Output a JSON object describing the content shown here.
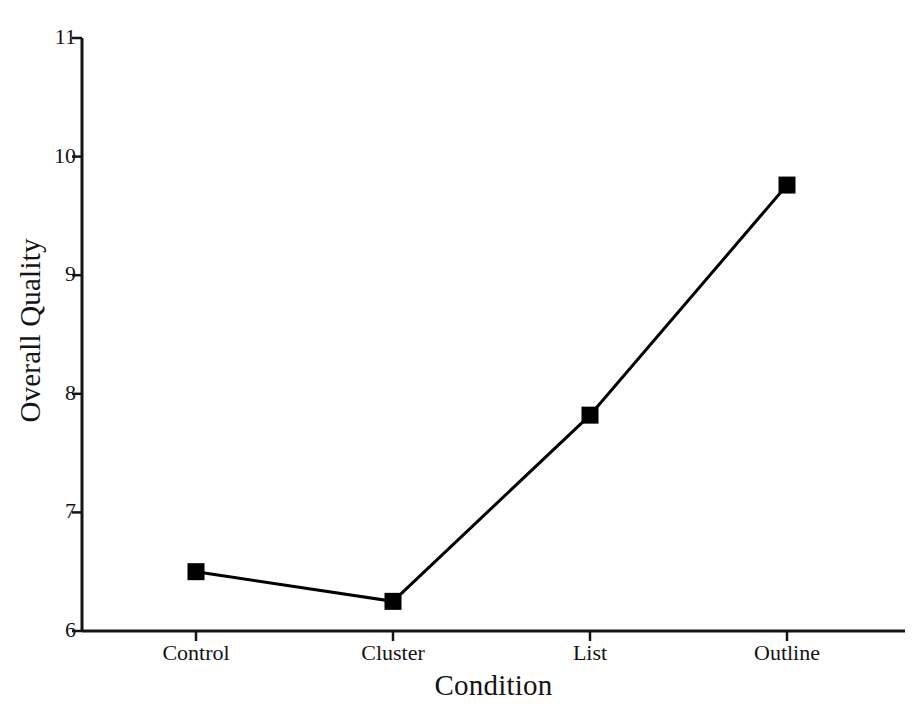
{
  "chart_data": {
    "type": "line",
    "title": "",
    "xlabel": "Condition",
    "ylabel": "Overall Quality",
    "categories": [
      "Control",
      "Cluster",
      "List",
      "Outline"
    ],
    "values": [
      6.5,
      6.25,
      7.82,
      9.76
    ],
    "series": [
      {
        "name": "Overall Quality",
        "values": [
          6.5,
          6.25,
          7.82,
          9.76
        ],
        "marker": "filled-square",
        "color": "#000000"
      }
    ],
    "ylim": [
      6,
      11
    ],
    "yticks": [
      6,
      7,
      8,
      9,
      10,
      11
    ],
    "ytick_labels": [
      "6",
      "7",
      "8",
      "9",
      "10",
      "11"
    ],
    "xtick_labels": [
      "Control",
      "Cluster",
      "List",
      "Outline"
    ],
    "grid": false,
    "legend": null,
    "axis_color": "#141414",
    "line_color": "#000000",
    "marker_color": "#000000",
    "background": "#ffffff"
  }
}
